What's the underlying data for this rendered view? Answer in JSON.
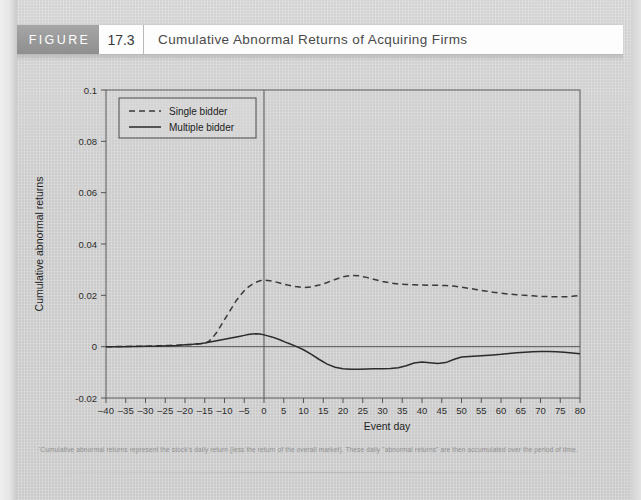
{
  "figure": {
    "label": "FIGURE",
    "number": "17.3",
    "title": "Cumulative Abnormal Returns  of Acquiring Firms"
  },
  "footnote": "'Cumulative abnormal returns represent the stock's daily return (less the return of the overall market). These daily \"abnormal returns\" are then accumulated over the period of time.",
  "colors": {
    "page_background": "#d2d2d2",
    "header_band": "#9a9a9a",
    "axis": "#555555",
    "single_bidder_line": "#3a3a3a",
    "multiple_bidder_line": "#2b2b2b"
  },
  "chart_data": {
    "type": "line",
    "title": "Cumulative Abnormal Returns  of Acquiring Firms",
    "xlabel": "Event day",
    "ylabel": "Cumulative abnormal returns",
    "xlim": [
      -40,
      80
    ],
    "ylim": [
      -0.02,
      0.1
    ],
    "xticks": [
      -40,
      -35,
      -30,
      -25,
      -20,
      -15,
      -10,
      -5,
      0,
      5,
      10,
      15,
      20,
      25,
      30,
      35,
      40,
      45,
      50,
      55,
      60,
      65,
      70,
      75,
      80
    ],
    "yticks": [
      -0.02,
      0,
      0.02,
      0.04,
      0.06,
      0.08,
      0.1
    ],
    "ytick_labels": [
      "-0.02",
      "0",
      "0.02",
      "0.04",
      "0.06",
      "0.08",
      "0.1"
    ],
    "grid": false,
    "legend_position": "top-left",
    "annotations": [
      {
        "type": "vline",
        "x": 0,
        "label": "event day zero"
      }
    ],
    "x": [
      -40,
      -38,
      -36,
      -34,
      -32,
      -30,
      -28,
      -26,
      -24,
      -22,
      -20,
      -18,
      -16,
      -15,
      -14,
      -13,
      -12,
      -11,
      -10,
      -9,
      -8,
      -7,
      -6,
      -5,
      -4,
      -3,
      -2,
      -1,
      0,
      2,
      4,
      6,
      8,
      10,
      12,
      14,
      16,
      18,
      20,
      22,
      24,
      26,
      28,
      30,
      32,
      34,
      36,
      38,
      40,
      42,
      44,
      46,
      48,
      50,
      52,
      54,
      56,
      58,
      60,
      62,
      64,
      66,
      68,
      70,
      72,
      74,
      76,
      78,
      80
    ],
    "series": [
      {
        "name": "Single bidder",
        "style": "dashed",
        "values": [
          0.0,
          0.0,
          0.0001,
          0.0001,
          0.0002,
          0.0002,
          0.0003,
          0.0004,
          0.0005,
          0.0006,
          0.0007,
          0.0009,
          0.0011,
          0.0013,
          0.002,
          0.0035,
          0.0055,
          0.008,
          0.0105,
          0.013,
          0.0155,
          0.018,
          0.02,
          0.0218,
          0.0232,
          0.0243,
          0.0251,
          0.0257,
          0.026,
          0.0256,
          0.0248,
          0.024,
          0.0234,
          0.023,
          0.0233,
          0.024,
          0.025,
          0.0262,
          0.0272,
          0.0278,
          0.0276,
          0.027,
          0.0262,
          0.0254,
          0.0248,
          0.0244,
          0.0242,
          0.0241,
          0.024,
          0.0239,
          0.0239,
          0.0238,
          0.0236,
          0.0232,
          0.0227,
          0.0222,
          0.0217,
          0.0212,
          0.0208,
          0.0205,
          0.0202,
          0.02,
          0.0198,
          0.0196,
          0.0195,
          0.0194,
          0.0194,
          0.0196,
          0.02
        ]
      },
      {
        "name": "Multiple bidder",
        "style": "solid",
        "values": [
          0.0,
          0.0,
          0.0,
          0.0001,
          0.0001,
          0.0002,
          0.0002,
          0.0003,
          0.0004,
          0.0005,
          0.0007,
          0.0009,
          0.0012,
          0.0014,
          0.0017,
          0.002,
          0.0023,
          0.0026,
          0.0029,
          0.0032,
          0.0035,
          0.0038,
          0.0041,
          0.0044,
          0.0047,
          0.0049,
          0.005,
          0.0049,
          0.0046,
          0.0038,
          0.0027,
          0.0014,
          0.0002,
          -0.0012,
          -0.003,
          -0.005,
          -0.0068,
          -0.008,
          -0.0086,
          -0.0088,
          -0.0088,
          -0.0087,
          -0.0086,
          -0.0086,
          -0.0085,
          -0.0082,
          -0.0074,
          -0.0064,
          -0.006,
          -0.0063,
          -0.0066,
          -0.0062,
          -0.005,
          -0.004,
          -0.0038,
          -0.0036,
          -0.0034,
          -0.0032,
          -0.003,
          -0.0027,
          -0.0024,
          -0.0022,
          -0.002,
          -0.0019,
          -0.0019,
          -0.002,
          -0.0022,
          -0.0025,
          -0.0028
        ]
      }
    ]
  }
}
